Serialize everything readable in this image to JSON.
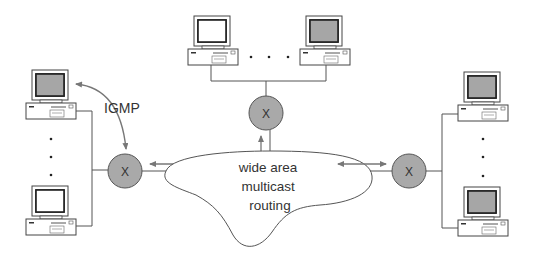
{
  "diagram": {
    "type": "network-diagram",
    "router_label": "X",
    "igmp_label": "IGMP",
    "cloud_label_lines": [
      "wide area",
      "multicast",
      "routing"
    ],
    "colors": {
      "router_fill": "#a9a9a9",
      "line": "#555555",
      "arrow": "#777777",
      "screen": "#a6a6a6",
      "screen_white": "#ffffff"
    },
    "groups": {
      "left": {
        "hosts": 2,
        "ellipsis": "vertical"
      },
      "top": {
        "hosts": 2,
        "ellipsis": "horizontal"
      },
      "right": {
        "hosts": 2,
        "ellipsis": "vertical"
      }
    }
  }
}
